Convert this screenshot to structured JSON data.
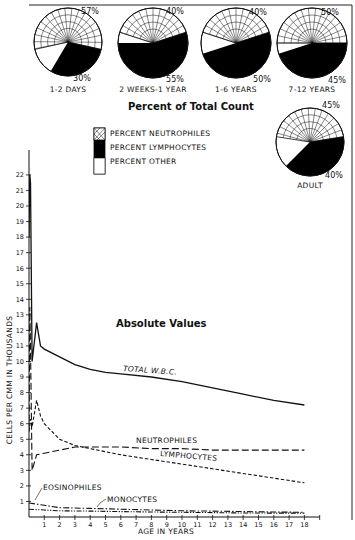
{
  "chart_data": [
    {
      "type": "pie",
      "title": "Percent of Total Count",
      "legend": [
        {
          "key": "neutrophiles",
          "label": "PERCENT NEUTROPHILES",
          "fill": "hatched"
        },
        {
          "key": "lymphocytes",
          "label": "PERCENT LYMPHOCYTES",
          "fill": "#000000"
        },
        {
          "key": "other",
          "label": "PERCENT OTHER",
          "fill": "#ffffff"
        }
      ],
      "pies": [
        {
          "label": "1-2 DAYS",
          "neutrophiles": 57,
          "lymphocytes": 30,
          "other": 13,
          "label_top": "57%",
          "label_bottom": "30%"
        },
        {
          "label": "2 WEEKS-1 YEAR",
          "neutrophiles": 40,
          "lymphocytes": 55,
          "other": 5,
          "label_top": "40%",
          "label_bottom": "55%"
        },
        {
          "label": "1-6 YEARS",
          "neutrophiles": 40,
          "lymphocytes": 50,
          "other": 10,
          "label_top": "40%",
          "label_bottom": "50%"
        },
        {
          "label": "7-12 YEARS",
          "neutrophiles": 50,
          "lymphocytes": 45,
          "other": 5,
          "label_top": "50%",
          "label_bottom": "45%"
        },
        {
          "label": "ADULT",
          "neutrophiles": 45,
          "lymphocytes": 40,
          "other": 15,
          "label_top": "45%",
          "label_bottom": "40%"
        }
      ]
    },
    {
      "type": "line",
      "title": "Absolute Values",
      "xlabel": "AGE IN YEARS",
      "ylabel": "CELLS PER CMM IN THOUSANDS",
      "xlim": [
        0,
        19
      ],
      "ylim": [
        0,
        22
      ],
      "xticks": [
        1,
        2,
        3,
        4,
        5,
        6,
        7,
        8,
        9,
        10,
        11,
        12,
        13,
        14,
        15,
        16,
        17,
        18
      ],
      "yticks": [
        1,
        2,
        3,
        4,
        5,
        6,
        7,
        8,
        9,
        10,
        11,
        12,
        13,
        14,
        15,
        16,
        17,
        18,
        19,
        20,
        21,
        22
      ],
      "grid": false,
      "series": [
        {
          "name": "TOTAL W.B.C.",
          "style": "solid",
          "x": [
            0,
            0.05,
            0.1,
            0.2,
            0.5,
            0.75,
            1,
            2,
            3,
            4,
            5,
            6,
            8,
            10,
            12,
            14,
            16,
            18
          ],
          "y": [
            18,
            22,
            21.5,
            10,
            12.5,
            11,
            10.8,
            10.3,
            9.8,
            9.5,
            9.3,
            9.2,
            9.0,
            8.7,
            8.3,
            7.9,
            7.5,
            7.2
          ]
        },
        {
          "name": "NEUTROPHILES",
          "style": "long-dash",
          "x": [
            0,
            0.05,
            0.1,
            0.2,
            0.5,
            1,
            2,
            3,
            4,
            6,
            8,
            10,
            12,
            14,
            16,
            18
          ],
          "y": [
            5.5,
            13.5,
            11,
            3,
            4,
            4.1,
            4.3,
            4.5,
            4.5,
            4.5,
            4.4,
            4.4,
            4.3,
            4.3,
            4.3,
            4.3
          ]
        },
        {
          "name": "LYMPHOCYTES",
          "style": "short-dash",
          "x": [
            0,
            0.1,
            0.2,
            0.5,
            0.75,
            1,
            2,
            3,
            4,
            6,
            8,
            10,
            12,
            14,
            16,
            18
          ],
          "y": [
            5.5,
            6.3,
            5.8,
            7.5,
            6.5,
            6.0,
            5.0,
            4.6,
            4.4,
            4.0,
            3.7,
            3.4,
            3.1,
            2.8,
            2.5,
            2.2
          ]
        },
        {
          "name": "EOSINOPHILES",
          "style": "dash-dot",
          "x": [
            0,
            1,
            2,
            4,
            6,
            8,
            10,
            12,
            14,
            16,
            18
          ],
          "y": [
            0.9,
            0.75,
            0.6,
            0.55,
            0.5,
            0.45,
            0.4,
            0.38,
            0.35,
            0.32,
            0.3
          ]
        },
        {
          "name": "MONOCYTES",
          "style": "dash-dot-dot",
          "x": [
            0,
            1,
            2,
            4,
            6,
            8,
            10,
            12,
            14,
            16,
            18
          ],
          "y": [
            0.5,
            0.45,
            0.4,
            0.38,
            0.35,
            0.32,
            0.3,
            0.28,
            0.26,
            0.25,
            0.25
          ]
        }
      ],
      "annotations": [
        "TOTAL W.B.C.",
        "NEUTROPHILES",
        "LYMPHOCYTES",
        "EOSINOPHILES",
        "MONOCYTES"
      ]
    }
  ],
  "labels": {
    "pie_title": "Percent of Total Count",
    "line_title": "Absolute Values",
    "legend_neutrophiles": "PERCENT NEUTROPHILES",
    "legend_lymphocytes": "PERCENT LYMPHOCYTES",
    "legend_other": "PERCENT OTHER",
    "xlabel": "AGE IN YEARS",
    "ylabel": "CELLS PER CMM IN THOUSANDS",
    "series_total": "TOTAL W.B.C.",
    "series_neutrophiles": "NEUTROPHILES",
    "series_lymphocytes": "LYMPHOCYTES",
    "series_eosinophiles": "EOSINOPHILES",
    "series_monocytes": "MONOCYTES"
  }
}
